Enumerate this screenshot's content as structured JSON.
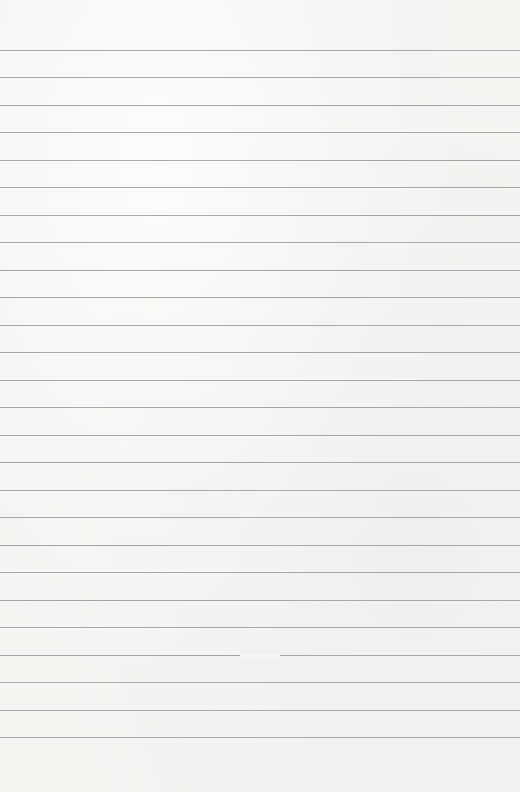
{
  "page": {
    "type": "lined-paper",
    "background_color": "#f4f4f3",
    "rule_color": "#9a9a9a",
    "first_rule_y": 49.5,
    "rule_spacing": 27.5,
    "rule_count": 26,
    "rule_gap": {
      "rule_index": 22,
      "x": 240,
      "width": 40
    }
  }
}
